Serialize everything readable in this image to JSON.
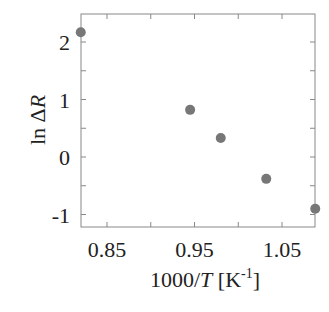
{
  "chart_data": {
    "type": "scatter",
    "title": "",
    "xlabel": "1000/T [K-1]",
    "ylabel": "ln ΔR",
    "x": [
      0.82,
      0.945,
      0.98,
      1.032,
      1.088
    ],
    "y": [
      2.17,
      0.82,
      0.33,
      -0.38,
      -0.9
    ],
    "xlim": [
      0.82,
      1.088
    ],
    "ylim": [
      -1.22,
      2.5
    ],
    "xticks": [
      "0.85",
      "0.95",
      "1.05"
    ],
    "yticks": [
      "2",
      "1",
      "0",
      "-1"
    ],
    "grid": false,
    "marker_color": "#777777"
  }
}
